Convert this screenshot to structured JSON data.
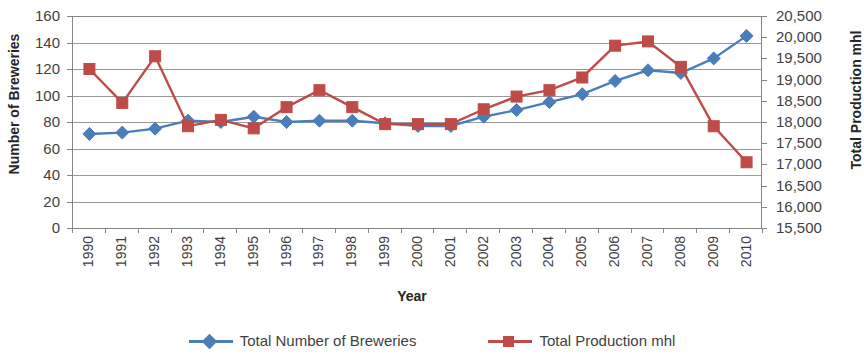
{
  "chart_data": {
    "type": "line",
    "title": "",
    "xlabel": "Year",
    "ylabel": "Number of  Breweries",
    "y2label": "Total Production mhl",
    "grid": true,
    "legend_position": "bottom",
    "categories": [
      "1990",
      "1991",
      "1992",
      "1993",
      "1994",
      "1995",
      "1996",
      "1997",
      "1998",
      "1999",
      "2000",
      "2001",
      "2002",
      "2003",
      "2004",
      "2005",
      "2006",
      "2007",
      "2008",
      "2009",
      "2010"
    ],
    "ylim": [
      0,
      160
    ],
    "yticks": [
      "0",
      "20",
      "40",
      "60",
      "80",
      "100",
      "120",
      "140",
      "160"
    ],
    "y2lim": [
      15500,
      20500
    ],
    "y2ticks": [
      "15,500",
      "16,000",
      "16,500",
      "17,000",
      "17,500",
      "18,000",
      "18,500",
      "19,000",
      "19,500",
      "20,000",
      "20,500"
    ],
    "series": [
      {
        "name": "Total Number of Breweries",
        "axis": "left",
        "color": "#4A7EBB",
        "marker": "diamond",
        "values": [
          71,
          72,
          75,
          81,
          80,
          84,
          80,
          81,
          81,
          79,
          77,
          77,
          84,
          89,
          95,
          101,
          111,
          119,
          117,
          128,
          145
        ]
      },
      {
        "name": "Total Production mhl",
        "axis": "right",
        "color": "#BE4B48",
        "marker": "square",
        "values": [
          19250,
          18450,
          19550,
          17900,
          18050,
          17850,
          18350,
          18750,
          18350,
          17950,
          17950,
          17950,
          18300,
          18600,
          18750,
          19050,
          19800,
          19900,
          19300,
          17900,
          17050
        ]
      }
    ],
    "legend": [
      {
        "label": "Total Number of Breweries",
        "color": "#4A7EBB",
        "marker": "diamond"
      },
      {
        "label": "Total Production mhl",
        "color": "#BE4B48",
        "marker": "square"
      }
    ]
  }
}
